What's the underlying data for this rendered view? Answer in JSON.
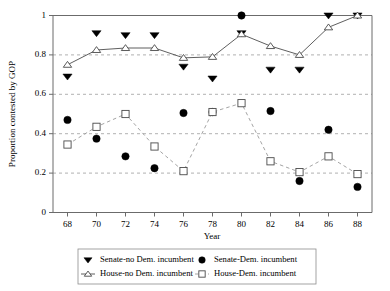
{
  "chart_data": {
    "type": "line",
    "title": "",
    "xlabel": "Year",
    "ylabel": "Proportion contested by GOP",
    "x": [
      68,
      70,
      72,
      74,
      76,
      78,
      80,
      82,
      84,
      86,
      88
    ],
    "xtick_labels": [
      "68",
      "70",
      "72",
      "74",
      "76",
      "78",
      "80",
      "82",
      "84",
      "86",
      "88"
    ],
    "ytick_labels": [
      "0",
      "0.2",
      "0.4",
      "0.6",
      "0.8",
      "1"
    ],
    "yticks": [
      0,
      0.2,
      0.4,
      0.6,
      0.8,
      1
    ],
    "xlim": [
      67,
      89
    ],
    "ylim": [
      0,
      1
    ],
    "grid": "horizontal-dashed",
    "legend_position": "bottom-center",
    "series": [
      {
        "name": "Senate-no Dem. incumbent",
        "marker": "filled-triangle-down",
        "line": "none",
        "color": "#000000",
        "values": [
          0.69,
          0.91,
          0.9,
          0.9,
          0.74,
          0.68,
          0.91,
          0.725,
          0.725,
          1.0,
          1.0
        ]
      },
      {
        "name": "Senate-Dem. incumbent",
        "marker": "filled-circle",
        "line": "none",
        "color": "#000000",
        "values": [
          0.47,
          0.375,
          0.285,
          0.225,
          0.505,
          0.51,
          1.0,
          0.515,
          0.16,
          0.42,
          0.13
        ]
      },
      {
        "name": "House-no Dem. incumbent",
        "marker": "open-triangle-up",
        "line": "solid",
        "color": "#4d4d4d",
        "values": [
          0.75,
          0.825,
          0.835,
          0.835,
          0.785,
          0.79,
          0.905,
          0.845,
          0.8,
          0.94,
          1.0
        ]
      },
      {
        "name": "House-Dem. incumbent",
        "marker": "open-square",
        "line": "dashed",
        "color": "#9a9a9a",
        "values": [
          0.345,
          0.435,
          0.5,
          0.335,
          0.21,
          0.51,
          0.555,
          0.26,
          0.205,
          0.285,
          0.195
        ]
      }
    ]
  },
  "legend": {
    "entries": [
      {
        "label": "Senate-no Dem. incumbent",
        "marker": "filled-triangle-down",
        "line": "none"
      },
      {
        "label": "Senate-Dem. incumbent",
        "marker": "filled-circle",
        "line": "none"
      },
      {
        "label": "House-no Dem. incumbent",
        "marker": "open-triangle-up",
        "line": "solid"
      },
      {
        "label": "House-Dem. incumbent",
        "marker": "open-square",
        "line": "dashed"
      }
    ]
  }
}
